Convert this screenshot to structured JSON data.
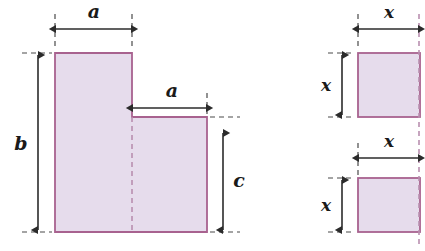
{
  "figure": {
    "colors": {
      "fill": "#e6dcec",
      "stroke": "#a8628f",
      "dash": "#b98fb0",
      "dimension": "#2b2b2b",
      "background": "#ffffff"
    },
    "left_shape": {
      "name": "l-shape",
      "labels": {
        "top_width": "a",
        "middle_width": "a",
        "left_height": "b",
        "right_height": "c"
      },
      "geometry": {
        "tall_left": 55,
        "tall_right": 132,
        "tall_top": 53,
        "shape_bottom": 232,
        "low_right": 207,
        "step_top": 117
      }
    },
    "right_shape": {
      "name": "two-squares",
      "labels": {
        "top_square_width": "x",
        "top_square_height": "x",
        "bottom_square_width": "x",
        "bottom_square_height": "x"
      },
      "geometry": {
        "left": 358,
        "right": 420,
        "top_square_top": 53,
        "top_square_bottom": 117,
        "bottom_square_top": 178,
        "bottom_square_bottom": 232
      }
    }
  }
}
